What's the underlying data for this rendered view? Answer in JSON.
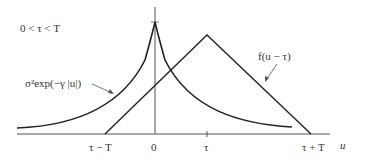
{
  "diagram": {
    "condition_label": "0 < τ < T",
    "exp_label": "σ²exp(−γ |u|)",
    "f_label": "f(u − τ)",
    "axis_label": "u",
    "ticks": [
      "τ − T",
      "0",
      "τ",
      "τ + T"
    ],
    "colors": {
      "line": "#222222",
      "axis": "#555555",
      "text": "#333333"
    }
  }
}
